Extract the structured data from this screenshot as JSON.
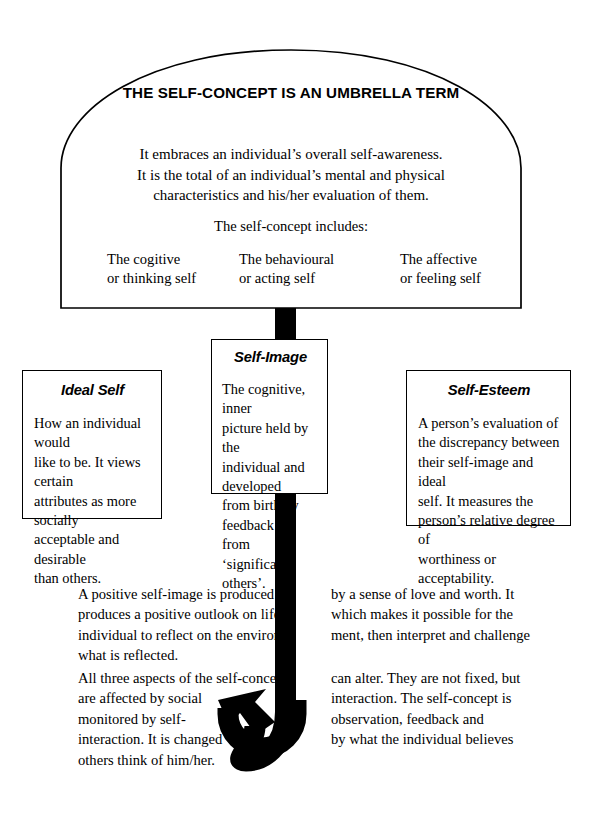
{
  "diagram": {
    "canopy": {
      "title": "THE SELF-CONCEPT IS AN UMBRELLA TERM",
      "body": "It embraces an individual’s overall self-awareness.\nIt is the total of an individual’s mental and physical\ncharacteristics and his/her evaluation of them.",
      "includes_label": "The self-concept includes:",
      "aspects": [
        "The cogitive\nor thinking self",
        "The behavioural\nor acting self",
        "The affective\nor feeling self"
      ]
    },
    "boxes": [
      {
        "title": "Ideal Self",
        "body": "How an individual would\nlike to be. It views certain\nattributes as more socially\nacceptable and desirable\nthan others."
      },
      {
        "title": "Self-Image",
        "body": "The cognitive, inner\npicture held by the\nindividual and developed\nfrom birth by feedback\nfrom ‘significant others’."
      },
      {
        "title": "Self-Esteem",
        "body": "A person’s evaluation of\nthe discrepancy between\ntheir self-image and ideal\nself. It measures the\nperson’s relative degree of\nworthiness or acceptability."
      }
    ],
    "paragraphs": [
      {
        "left": "A positive self-image is produced\nproduces a positive outlook on life\nindividual to reflect on the environ-\nwhat is reflected.",
        "right": "by a sense of love and worth. It\nwhich makes it possible for the\nment, then interpret and challenge"
      },
      {
        "left": "All three aspects of the self-concept\nare affected by social\nmonitored by self-\ninteraction. It is changed\nothers think of him/her.",
        "right": "can alter. They are not fixed, but\ninteraction. The self-concept is\nobservation, feedback and\nby what the individual believes"
      }
    ],
    "colors": {
      "ink": "#000000",
      "paper": "#ffffff"
    }
  }
}
